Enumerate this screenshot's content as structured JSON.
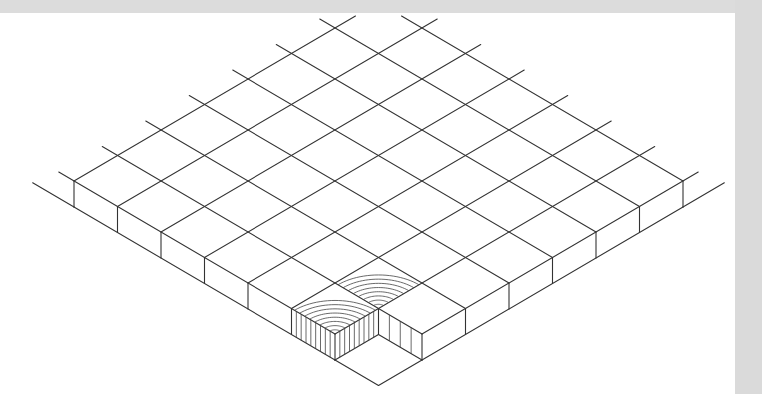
{
  "figure": {
    "colors": {
      "line": "#333333",
      "paper": "#ffffff",
      "border": "#d9d9d9"
    }
  },
  "geometry": {
    "grid_size": 7,
    "front_corner": [
      378.5,
      359.5
    ],
    "step_x": 43.5,
    "step_y": 25.5,
    "thickness": 26,
    "removed_tile": [
      6,
      6
    ],
    "end_grain_tiles": [
      [
        5,
        6
      ],
      [
        6,
        5
      ]
    ],
    "ring_count": 8,
    "top_clip_y": 16
  }
}
